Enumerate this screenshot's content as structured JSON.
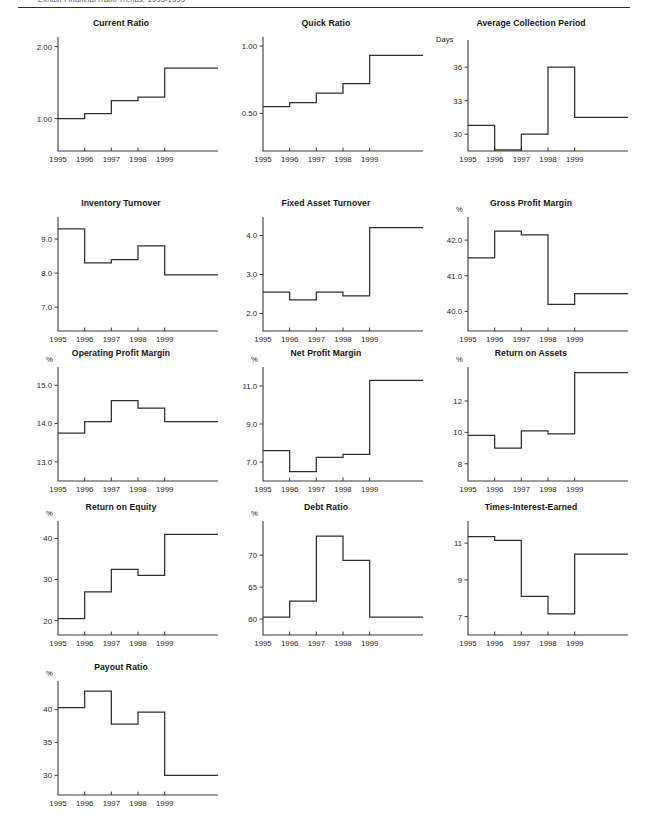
{
  "page": {
    "header_text": "Exhibit   Financial Ratio Trends, 1995-1999",
    "width": 646,
    "height": 818,
    "line_color": "#2d2d2d",
    "axis_color": "#3a3a3a",
    "background": "#ffffff"
  },
  "x_tick_labels": [
    "1995",
    "1996",
    "1997",
    "1998",
    "1999"
  ],
  "charts": [
    {
      "id": "current-ratio",
      "chart_data": {
        "type": "line",
        "title": "Current Ratio",
        "xlabel": "",
        "ylabel": "",
        "unit": "",
        "categories": [
          "1995",
          "1996",
          "1997",
          "1998",
          "1999"
        ],
        "values": [
          1.0,
          1.07,
          1.25,
          1.3,
          1.7
        ],
        "ytick_labels": [
          "1.00",
          "2.00"
        ],
        "ytick_values": [
          1.0,
          2.0
        ],
        "ylim": [
          0.55,
          2.12
        ],
        "grid": false,
        "legend": "none",
        "step": true
      }
    },
    {
      "id": "quick-ratio",
      "chart_data": {
        "type": "line",
        "title": "Quick Ratio",
        "xlabel": "",
        "ylabel": "",
        "unit": "",
        "categories": [
          "1995",
          "1996",
          "1997",
          "1998",
          "1999"
        ],
        "values": [
          0.55,
          0.58,
          0.65,
          0.72,
          0.93
        ],
        "ytick_labels": [
          "0.50",
          "1.00"
        ],
        "ytick_values": [
          0.5,
          1.0
        ],
        "ylim": [
          0.22,
          1.06
        ],
        "grid": false,
        "legend": "none",
        "step": true
      }
    },
    {
      "id": "average-collection-period",
      "chart_data": {
        "type": "line",
        "title": "Average Collection Period",
        "xlabel": "",
        "ylabel": "Days",
        "unit": "Days",
        "categories": [
          "1995",
          "1996",
          "1997",
          "1998",
          "1999"
        ],
        "values": [
          30.8,
          28.6,
          30.0,
          36.0,
          31.5
        ],
        "ytick_labels": [
          "30",
          "33",
          "36"
        ],
        "ytick_values": [
          30,
          33,
          36
        ],
        "ylim": [
          28.5,
          38.6
        ],
        "grid": false,
        "legend": "none",
        "step": true
      }
    },
    {
      "id": "inventory-turnover",
      "chart_data": {
        "type": "line",
        "title": "Inventory Turnover",
        "xlabel": "",
        "ylabel": "",
        "unit": "",
        "categories": [
          "1995",
          "1996",
          "1997",
          "1998",
          "1999"
        ],
        "values": [
          9.3,
          8.3,
          8.4,
          8.8,
          7.95
        ],
        "ytick_labels": [
          "7.0",
          "8.0",
          "9.0"
        ],
        "ytick_values": [
          7.0,
          8.0,
          9.0
        ],
        "ylim": [
          6.3,
          9.62
        ],
        "grid": false,
        "legend": "none",
        "step": true
      }
    },
    {
      "id": "fixed-asset-turnover",
      "chart_data": {
        "type": "line",
        "title": "Fixed Asset Turnover",
        "xlabel": "",
        "ylabel": "",
        "unit": "",
        "categories": [
          "1995",
          "1996",
          "1997",
          "1998",
          "1999"
        ],
        "values": [
          2.55,
          2.35,
          2.55,
          2.45,
          4.2
        ],
        "ytick_labels": [
          "2.0",
          "3.0",
          "4.0"
        ],
        "ytick_values": [
          2.0,
          3.0,
          4.0
        ],
        "ylim": [
          1.55,
          4.45
        ],
        "grid": false,
        "legend": "none",
        "step": true
      }
    },
    {
      "id": "gross-profit-margin",
      "chart_data": {
        "type": "line",
        "title": "Gross Profit Margin",
        "xlabel": "",
        "ylabel": "%",
        "unit": "%",
        "categories": [
          "1995",
          "1996",
          "1997",
          "1998",
          "1999"
        ],
        "values": [
          41.5,
          42.25,
          42.15,
          40.2,
          40.5
        ],
        "ytick_labels": [
          "40.0",
          "41.0",
          "42.0"
        ],
        "ytick_values": [
          40.0,
          41.0,
          42.0
        ],
        "ylim": [
          39.45,
          42.62
        ],
        "grid": false,
        "legend": "none",
        "step": true
      }
    },
    {
      "id": "operating-profit-margin",
      "chart_data": {
        "type": "line",
        "title": "Operating Profit Margin",
        "xlabel": "",
        "ylabel": "%",
        "unit": "%",
        "categories": [
          "1995",
          "1996",
          "1997",
          "1998",
          "1999"
        ],
        "values": [
          13.75,
          14.05,
          14.6,
          14.4,
          14.05
        ],
        "ytick_labels": [
          "13.0",
          "14.0",
          "15.0"
        ],
        "ytick_values": [
          13.0,
          14.0,
          15.0
        ],
        "ylim": [
          12.5,
          15.45
        ],
        "grid": false,
        "legend": "none",
        "step": true
      }
    },
    {
      "id": "net-profit-margin",
      "chart_data": {
        "type": "line",
        "title": "Net Profit Margin",
        "xlabel": "",
        "ylabel": "%",
        "unit": "%",
        "categories": [
          "1995",
          "1996",
          "1997",
          "1998",
          "1999"
        ],
        "values": [
          7.6,
          6.5,
          7.25,
          7.4,
          11.3
        ],
        "ytick_labels": [
          "7.0",
          "9.0",
          "11.0"
        ],
        "ytick_values": [
          7.0,
          9.0,
          11.0
        ],
        "ylim": [
          6.0,
          11.95
        ],
        "grid": false,
        "legend": "none",
        "step": true
      }
    },
    {
      "id": "return-on-assets",
      "chart_data": {
        "type": "line",
        "title": "Return on Assets",
        "xlabel": "",
        "ylabel": "%",
        "unit": "%",
        "categories": [
          "1995",
          "1996",
          "1997",
          "1998",
          "1999"
        ],
        "values": [
          9.8,
          9.0,
          10.1,
          9.9,
          13.8
        ],
        "ytick_labels": [
          "8",
          "10",
          "12"
        ],
        "ytick_values": [
          8,
          10,
          12
        ],
        "ylim": [
          6.9,
          14.1
        ],
        "grid": false,
        "legend": "none",
        "step": true
      }
    },
    {
      "id": "return-on-equity",
      "chart_data": {
        "type": "line",
        "title": "Return on Equity",
        "xlabel": "",
        "ylabel": "%",
        "unit": "%",
        "categories": [
          "1995",
          "1996",
          "1997",
          "1998",
          "1999"
        ],
        "values": [
          20.5,
          27.0,
          32.5,
          31.0,
          41.0
        ],
        "ytick_labels": [
          "20",
          "30",
          "40"
        ],
        "ytick_values": [
          20,
          30,
          40
        ],
        "ylim": [
          16.5,
          44.0
        ],
        "grid": false,
        "legend": "none",
        "step": true
      }
    },
    {
      "id": "debt-ratio",
      "chart_data": {
        "type": "line",
        "title": "Debt Ratio",
        "xlabel": "",
        "ylabel": "%",
        "unit": "%",
        "categories": [
          "1995",
          "1996",
          "1997",
          "1998",
          "1999"
        ],
        "values": [
          60.3,
          62.8,
          73.0,
          69.2,
          60.3
        ],
        "ytick_labels": [
          "60",
          "65",
          "70"
        ],
        "ytick_values": [
          60,
          65,
          70
        ],
        "ylim": [
          57.5,
          75.2
        ],
        "grid": false,
        "legend": "none",
        "step": true
      }
    },
    {
      "id": "times-interest-earned",
      "chart_data": {
        "type": "line",
        "title": "Times-Interest-Earned",
        "xlabel": "",
        "ylabel": "",
        "unit": "",
        "categories": [
          "1995",
          "1996",
          "1997",
          "1998",
          "1999"
        ],
        "values": [
          11.35,
          11.15,
          8.1,
          7.15,
          10.4
        ],
        "ytick_labels": [
          "7",
          "9",
          "11"
        ],
        "ytick_values": [
          7,
          9,
          11
        ],
        "ylim": [
          6.0,
          12.15
        ],
        "grid": false,
        "legend": "none",
        "step": true
      }
    },
    {
      "id": "payout-ratio",
      "chart_data": {
        "type": "line",
        "title": "Payout Ratio",
        "xlabel": "",
        "ylabel": "%",
        "unit": "%",
        "categories": [
          "1995",
          "1996",
          "1997",
          "1998",
          "1999"
        ],
        "values": [
          40.3,
          42.8,
          37.8,
          39.6,
          30.0
        ],
        "ytick_labels": [
          "30",
          "35",
          "40"
        ],
        "ytick_values": [
          30,
          35,
          40
        ],
        "ylim": [
          27.0,
          44.2
        ],
        "grid": false,
        "legend": "none",
        "step": true
      }
    }
  ],
  "layout": {
    "positions": [
      {
        "left": 18,
        "top": 8
      },
      {
        "left": 223,
        "top": 8
      },
      {
        "left": 428,
        "top": 8
      },
      {
        "left": 18,
        "top": 188
      },
      {
        "left": 223,
        "top": 188
      },
      {
        "left": 428,
        "top": 188
      },
      {
        "left": 18,
        "top": 338
      },
      {
        "left": 223,
        "top": 338
      },
      {
        "left": 428,
        "top": 338
      },
      {
        "left": 18,
        "top": 492
      },
      {
        "left": 223,
        "top": 492
      },
      {
        "left": 428,
        "top": 492
      },
      {
        "left": 18,
        "top": 652
      }
    ]
  }
}
